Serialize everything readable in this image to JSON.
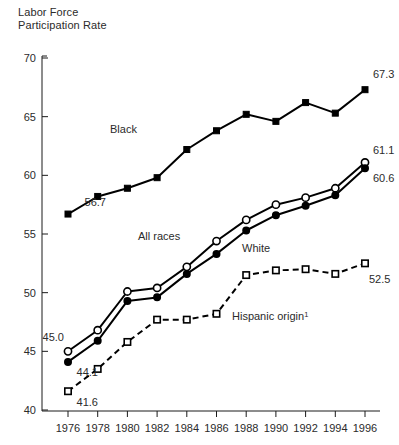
{
  "chart_data": {
    "type": "line",
    "title_line1": "Labor Force",
    "title_line2": "Participation Rate",
    "xlabel": "",
    "ylabel": "Labor Force Participation Rate",
    "ylim": [
      40,
      70
    ],
    "xlim": [
      1976,
      1996
    ],
    "grid": false,
    "legend_position": "inline-annotations",
    "x": [
      1976,
      1978,
      1980,
      1982,
      1984,
      1986,
      1988,
      1990,
      1992,
      1994,
      1996
    ],
    "categories": [
      "1976",
      "1978",
      "1980",
      "1982",
      "1984",
      "1986",
      "1988",
      "1990",
      "1992",
      "1994",
      "1996"
    ],
    "ytick_labels": [
      "70",
      "65",
      "60",
      "55",
      "50",
      "45",
      "40"
    ],
    "ytick_values": [
      70,
      65,
      60,
      55,
      50,
      45,
      40
    ],
    "series": [
      {
        "name": "Black",
        "label": "Black",
        "marker": "filled-square",
        "linestyle": "solid",
        "values": [
          56.7,
          58.2,
          58.9,
          59.8,
          62.2,
          63.8,
          65.2,
          64.6,
          66.2,
          65.3,
          67.3
        ],
        "first_value_label": "56.7",
        "last_value_label": "67.3"
      },
      {
        "name": "All races",
        "label": "All races",
        "marker": "open-circle",
        "linestyle": "solid",
        "values": [
          45.0,
          46.8,
          50.1,
          50.4,
          52.2,
          54.4,
          56.2,
          57.5,
          58.1,
          58.9,
          61.1
        ],
        "first_value_label": "45.0",
        "last_value_label": "61.1"
      },
      {
        "name": "White",
        "label": "White",
        "marker": "filled-circle",
        "linestyle": "solid",
        "values": [
          44.1,
          45.9,
          49.3,
          49.6,
          51.6,
          53.3,
          55.3,
          56.6,
          57.4,
          58.3,
          60.6
        ],
        "first_value_label": "44.1",
        "last_value_label": "60.6"
      },
      {
        "name": "Hispanic origin",
        "label": "Hispanic origin",
        "label_superscript": "1",
        "marker": "open-square",
        "linestyle": "dashed",
        "values": [
          41.6,
          43.5,
          45.8,
          47.7,
          47.7,
          48.2,
          51.5,
          51.9,
          52.0,
          51.6,
          52.5
        ],
        "first_value_label": "41.6",
        "last_value_label": "52.5"
      }
    ],
    "annotations": [
      {
        "text": "56.7",
        "series": "Black",
        "anchor": "first"
      },
      {
        "text": "67.3",
        "series": "Black",
        "anchor": "last"
      },
      {
        "text": "45.0",
        "series": "All races",
        "anchor": "first"
      },
      {
        "text": "61.1",
        "series": "All races",
        "anchor": "last"
      },
      {
        "text": "44.1",
        "series": "White",
        "anchor": "first"
      },
      {
        "text": "60.6",
        "series": "White",
        "anchor": "last"
      },
      {
        "text": "41.6",
        "series": "Hispanic origin",
        "anchor": "first"
      },
      {
        "text": "52.5",
        "series": "Hispanic origin",
        "anchor": "last"
      }
    ]
  }
}
